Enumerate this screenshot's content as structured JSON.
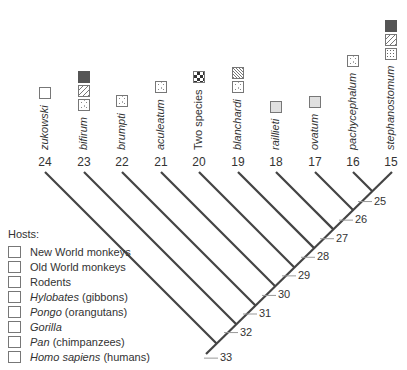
{
  "figure": {
    "type": "phylogenetic-tree",
    "tips": [
      {
        "num": "24",
        "name": "zukowski",
        "italic": true,
        "hosts": [
          "nwm"
        ]
      },
      {
        "num": "23",
        "name": "bifirum",
        "italic": true,
        "hosts": [
          "owm",
          "pan",
          "hom"
        ]
      },
      {
        "num": "22",
        "name": "brumpti",
        "italic": true,
        "hosts": [
          "owm"
        ]
      },
      {
        "num": "21",
        "name": "aculeatum",
        "italic": true,
        "hosts": [
          "owm"
        ]
      },
      {
        "num": "20",
        "name": "Two species",
        "italic": false,
        "hosts": [
          "rod"
        ]
      },
      {
        "num": "19",
        "name": "blanchardi",
        "italic": true,
        "hosts": [
          "owm",
          "pon"
        ]
      },
      {
        "num": "18",
        "name": "raillieti",
        "italic": true,
        "hosts": [
          "hyl"
        ]
      },
      {
        "num": "17",
        "name": "ovatum",
        "italic": true,
        "hosts": [
          "hyl"
        ]
      },
      {
        "num": "16",
        "name": "pachycephalum",
        "italic": true,
        "hosts": [
          "owm"
        ]
      },
      {
        "num": "15",
        "name": "stephanostomum",
        "italic": true,
        "hosts": [
          "gor",
          "pan",
          "hom"
        ]
      }
    ],
    "nodes": [
      "25",
      "26",
      "27",
      "28",
      "29",
      "30",
      "31",
      "32",
      "33"
    ]
  },
  "legend": {
    "title": "Hosts:",
    "items": [
      {
        "key": "nwm",
        "label_italic": "",
        "label": "New World monkeys"
      },
      {
        "key": "owm",
        "label_italic": "",
        "label": "Old World monkeys"
      },
      {
        "key": "rod",
        "label_italic": "",
        "label": "Rodents"
      },
      {
        "key": "hyl",
        "label_italic": "Hylobates",
        "label": " (gibbons)"
      },
      {
        "key": "pon",
        "label_italic": "Pongo",
        "label": " (orangutans)"
      },
      {
        "key": "gor",
        "label_italic": "Gorilla",
        "label": ""
      },
      {
        "key": "pan",
        "label_italic": "Pan",
        "label": " (chimpanzees)"
      },
      {
        "key": "hom",
        "label_italic": "Homo sapiens",
        "label": " (humans)"
      }
    ]
  },
  "colors": {
    "line": "#444444",
    "text": "#333333",
    "tick": "#999999"
  }
}
